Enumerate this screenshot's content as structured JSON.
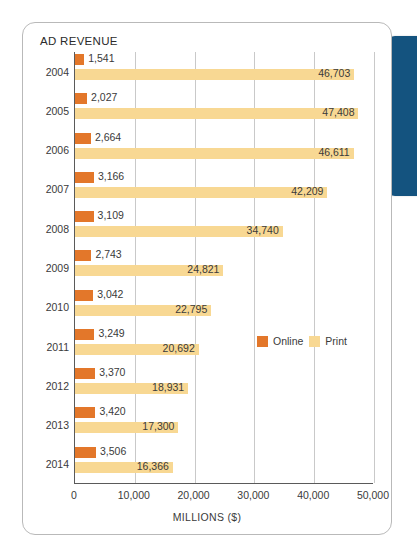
{
  "card": {
    "title": "AD REVENUE"
  },
  "decor": {
    "blue_tab_color": "#14537f",
    "card_border_color": "#b9b9b9"
  },
  "legend": {
    "position": "inside-right",
    "items": [
      {
        "label": "Online",
        "color": "#e3772a"
      },
      {
        "label": "Print",
        "color": "#f8d893"
      }
    ]
  },
  "axis": {
    "x_title": "MILLIONS ($)",
    "ticks": [
      "0",
      "10,000",
      "20,000",
      "30,000",
      "40,000",
      "50,000"
    ],
    "tick_values": [
      0,
      10000,
      20000,
      30000,
      40000,
      50000
    ]
  },
  "chart_data": {
    "type": "bar",
    "orientation": "horizontal",
    "title": "AD REVENUE",
    "xlabel": "MILLIONS ($)",
    "ylabel": "",
    "xlim": [
      0,
      50000
    ],
    "grid": true,
    "legend_position": "inside-right",
    "categories": [
      "2004",
      "2005",
      "2006",
      "2007",
      "2008",
      "2009",
      "2010",
      "2011",
      "2012",
      "2013",
      "2014"
    ],
    "series": [
      {
        "name": "Online",
        "color": "#e3772a",
        "values": [
          1541,
          2027,
          2664,
          3166,
          3109,
          2743,
          3042,
          3249,
          3370,
          3420,
          3506
        ],
        "labels": [
          "1,541",
          "2,027",
          "2,664",
          "3,166",
          "3,109",
          "2,743",
          "3,042",
          "3,249",
          "3,370",
          "3,420",
          "3,506"
        ]
      },
      {
        "name": "Print",
        "color": "#f8d893",
        "values": [
          46703,
          47408,
          46611,
          42209,
          34740,
          24821,
          22795,
          20692,
          18931,
          17300,
          16366
        ],
        "labels": [
          "46,703",
          "47,408",
          "46,611",
          "42,209",
          "34,740",
          "24,821",
          "22,795",
          "20,692",
          "18,931",
          "17,300",
          "16,366"
        ]
      }
    ]
  }
}
